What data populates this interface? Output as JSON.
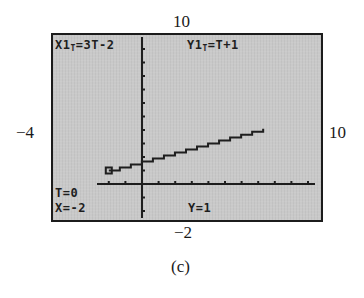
{
  "figure": {
    "caption": "(c)",
    "window_labels": {
      "ymax": "10",
      "ymin": "−2",
      "xmin": "−4",
      "xmax": "10"
    }
  },
  "screen": {
    "x_equation": {
      "name": "X1",
      "sub": "T",
      "expr": "=3T-2"
    },
    "y_equation": {
      "name": "Y1",
      "sub": "T",
      "expr": "=T+1"
    },
    "trace": {
      "t_readout": "T=0",
      "x_readout": "X=-2",
      "y_readout": "Y=1"
    }
  },
  "chart_data": {
    "type": "line",
    "title": "",
    "plot_kind": "parametric",
    "equations": {
      "x": "3T-2",
      "y": "T+1"
    },
    "series": [
      {
        "name": "X1T=3T-2, Y1T=T+1",
        "x": [
          -2,
          7.3
        ],
        "y": [
          1,
          4.1
        ]
      }
    ],
    "t_range": [
      0,
      3.1
    ],
    "trace_point": {
      "T": 0,
      "x": -2,
      "y": 1
    },
    "xlabel": "",
    "ylabel": "",
    "xlim": [
      -4,
      10
    ],
    "ylim": [
      -2,
      10
    ],
    "x_tick_step": 1,
    "y_tick_step": 1,
    "grid": false,
    "legend": "none",
    "colors": {
      "screen_bg": "#c9c9c9",
      "ink": "#1e1e1e",
      "border": "#1c1c1c"
    }
  }
}
